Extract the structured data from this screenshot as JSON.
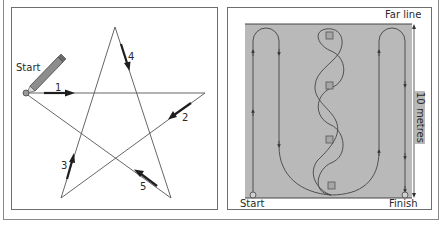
{
  "left_diagram": {
    "title": "Five-point star drawing sequence",
    "start_label": "Start",
    "stroke_labels": [
      "1",
      "2",
      "3",
      "4",
      "5"
    ],
    "icons": [
      "pencil-icon",
      "start-point-icon"
    ],
    "colors": {
      "line": "#555555",
      "arrow": "#222222",
      "pencil": "#888888"
    }
  },
  "right_diagram": {
    "title": "Weaving course layout",
    "far_line_label": "Far line",
    "distance_label": "10 metres",
    "start_label": "Start",
    "finish_label": "Finish",
    "cone_count": 4,
    "colors": {
      "field": "#b9b9b9",
      "path": "#4a4a4a",
      "cone": "#a8a8a8"
    }
  }
}
